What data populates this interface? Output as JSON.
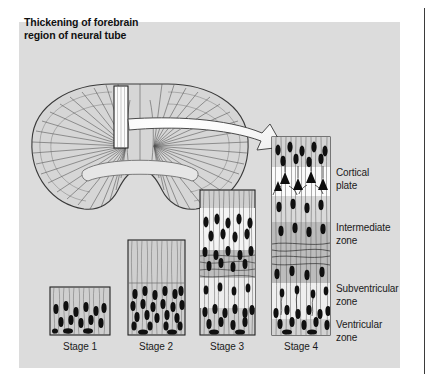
{
  "figure": {
    "title_line1": "Thickening of forebrain",
    "title_line2": "region of neural tube",
    "panel_background": "#dcdcdc",
    "page_background": "#ffffff",
    "ink_color": "#1a1a1a",
    "cell_color": "#101010"
  },
  "diagram": {
    "neural_tube_label": "forebrain-neural-tube-cross-section",
    "callout_label": "wall-segment-callout",
    "arrow_label": "magnification-arrow"
  },
  "zones": [
    {
      "id": "cortical-plate",
      "line1": "Cortical",
      "line2": "plate",
      "top": 167,
      "shade": "#ffffff"
    },
    {
      "id": "intermediate",
      "line1": "Intermediate",
      "line2": "zone",
      "top": 222,
      "shade": "#c0c0c0"
    },
    {
      "id": "subventricular",
      "line1": "Subventricular",
      "line2": "zone",
      "top": 283,
      "shade": "#efefef"
    },
    {
      "id": "ventricular",
      "line1": "Ventricular",
      "line2": "zone",
      "top": 319,
      "shade": "#d2d2d2"
    }
  ],
  "stages": [
    {
      "id": "stage-1",
      "label": "Stage 1",
      "x": 50,
      "width": 60,
      "top": 287,
      "bottom": 335,
      "cells": 14,
      "bands": 1
    },
    {
      "id": "stage-2",
      "label": "Stage 2",
      "x": 128,
      "width": 57,
      "top": 240,
      "bottom": 335,
      "cells": 22,
      "bands": 2
    },
    {
      "id": "stage-3",
      "label": "Stage 3",
      "x": 200,
      "width": 55,
      "top": 190,
      "bottom": 335,
      "cells": 30,
      "bands": 4
    },
    {
      "id": "stage-4",
      "label": "Stage 4",
      "x": 272,
      "width": 58,
      "top": 137,
      "bottom": 335,
      "cells": 38,
      "bands": 5
    }
  ],
  "stage_label_y": 341
}
